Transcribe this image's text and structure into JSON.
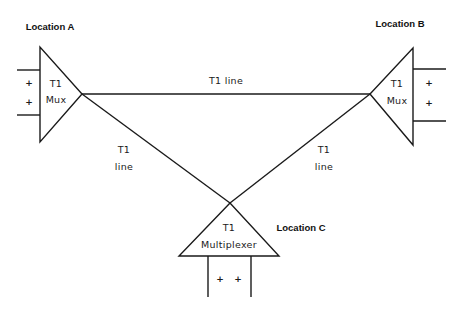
{
  "diagram": {
    "stroke_color": "#1a1a1a",
    "background": "#ffffff",
    "nodes": [
      {
        "id": "A",
        "location_label": "Location A",
        "device_line1": "T1",
        "device_line2": "Mux",
        "ports": [
          "+",
          "+"
        ]
      },
      {
        "id": "B",
        "location_label": "Location B",
        "device_line1": "T1",
        "device_line2": "Mux",
        "ports": [
          "+",
          "+"
        ]
      },
      {
        "id": "C",
        "location_label": "Location C",
        "device_line1": "T1",
        "device_line2": "Multiplexer",
        "ports": [
          "+",
          "+"
        ]
      }
    ],
    "links": [
      {
        "from": "A",
        "to": "B",
        "label_line1": "T1 line"
      },
      {
        "from": "A",
        "to": "C",
        "label_line1": "T1",
        "label_line2": "line"
      },
      {
        "from": "B",
        "to": "C",
        "label_line1": "T1",
        "label_line2": "line"
      }
    ]
  }
}
